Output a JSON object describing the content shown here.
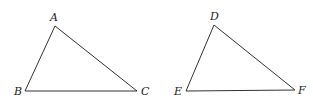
{
  "figure": {
    "triangles": [
      {
        "name": "ABC",
        "vertices": [
          {
            "label": "A",
            "x": 55,
            "y": 26,
            "lx": 50,
            "ly": 21
          },
          {
            "label": "B",
            "x": 25,
            "y": 91,
            "lx": 14,
            "ly": 95
          },
          {
            "label": "C",
            "x": 137,
            "y": 91,
            "lx": 141,
            "ly": 95
          }
        ]
      },
      {
        "name": "DEF",
        "vertices": [
          {
            "label": "D",
            "x": 214,
            "y": 25,
            "lx": 210,
            "ly": 20
          },
          {
            "label": "E",
            "x": 186,
            "y": 91,
            "lx": 174,
            "ly": 95
          },
          {
            "label": "F",
            "x": 295,
            "y": 90,
            "lx": 298,
            "ly": 94
          }
        ]
      }
    ]
  }
}
